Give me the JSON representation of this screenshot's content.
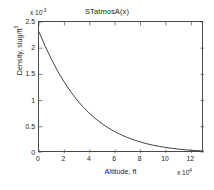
{
  "chart_data": {
    "type": "line",
    "title": "STatmosA(x)",
    "xlabel": "Altitude, ft",
    "ylabel": "Density, slug/ft",
    "ylabel_sup": "3",
    "x_exponent_prefix": "x 10",
    "x_exponent": "4",
    "y_exponent_prefix": "x 10",
    "y_exponent": "-3",
    "xlim": [
      0,
      13
    ],
    "ylim": [
      0,
      2.5
    ],
    "xticks": [
      "0",
      "2",
      "4",
      "6",
      "8",
      "10",
      "12"
    ],
    "xtick_values": [
      0,
      2,
      4,
      6,
      8,
      10,
      12
    ],
    "yticks": [
      "0",
      "0.5",
      "1",
      "1.5",
      "2",
      "2.5"
    ],
    "ytick_values": [
      0,
      0.5,
      1,
      1.5,
      2,
      2.5
    ],
    "grid": false,
    "legend": false,
    "line_color": "#2b2b2b",
    "series": [
      {
        "name": "Density",
        "x": [
          0,
          0.5,
          1,
          1.5,
          2,
          2.5,
          3,
          3.5,
          4,
          4.5,
          5,
          5.5,
          6,
          6.5,
          7,
          7.5,
          8,
          8.5,
          9,
          9.5,
          10,
          10.5,
          11,
          11.5,
          12,
          12.5,
          13
        ],
        "values": [
          2.31,
          2.03,
          1.78,
          1.55,
          1.35,
          1.17,
          1.01,
          0.872,
          0.751,
          0.645,
          0.553,
          0.473,
          0.404,
          0.344,
          0.292,
          0.247,
          0.209,
          0.176,
          0.148,
          0.125,
          0.105,
          0.088,
          0.074,
          0.062,
          0.052,
          0.044,
          0.037
        ]
      }
    ]
  }
}
